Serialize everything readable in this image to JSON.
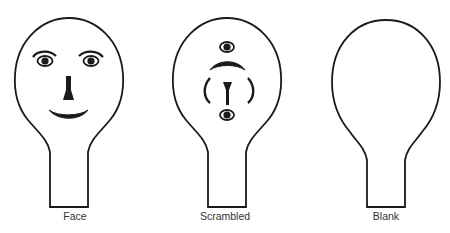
{
  "figures": [
    {
      "id": "face",
      "label": "Face"
    },
    {
      "id": "scrambled",
      "label": "Scrambled"
    },
    {
      "id": "blank",
      "label": "Blank"
    }
  ],
  "colors": {
    "stroke": "#1a1a1a",
    "label": "#333333",
    "background": "#ffffff"
  }
}
